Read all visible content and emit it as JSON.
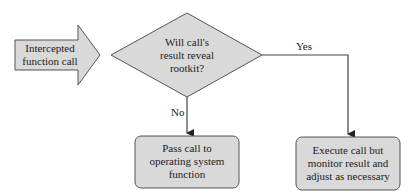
{
  "diagram": {
    "type": "flowchart",
    "colors": {
      "fill": "#d9d9d9",
      "stroke": "#555555",
      "line": "#444444",
      "text": "#222222"
    },
    "nodes": {
      "input": {
        "shape": "block-arrow",
        "label_line1": "Intercepted",
        "label_line2": "function call"
      },
      "decision": {
        "shape": "diamond",
        "label_line1": "Will call's",
        "label_line2": "result reveal",
        "label_line3": "rootkit?"
      },
      "no_action": {
        "shape": "rounded-rect",
        "label_line1": "Pass call to",
        "label_line2": "operating system",
        "label_line3": "function"
      },
      "yes_action": {
        "shape": "rounded-rect",
        "label_line1": "Execute call but",
        "label_line2": "monitor result and",
        "label_line3": "adjust as necessary"
      }
    },
    "edges": {
      "yes": {
        "from": "decision",
        "to": "yes_action",
        "label": "Yes"
      },
      "no": {
        "from": "decision",
        "to": "no_action",
        "label": "No"
      }
    }
  }
}
